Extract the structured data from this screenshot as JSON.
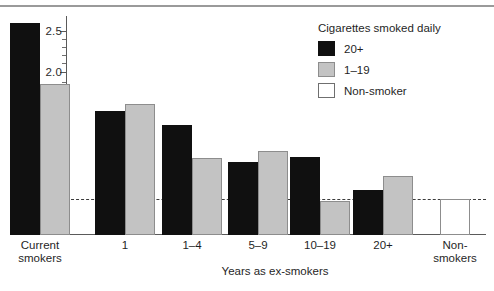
{
  "chart_data": {
    "type": "bar",
    "title": "",
    "xlabel": "Years as ex-smokers",
    "ylabel": "Mortality ratios",
    "categories": [
      "Current\nsmokers",
      "1",
      "1–4",
      "5–9",
      "10–19",
      "20+",
      "Non-\nsmokers"
    ],
    "yticks": [
      1.0,
      1.2,
      1.5,
      1.7,
      2.0,
      2.5
    ],
    "ytick_labels": [
      "1.0",
      "1.2",
      "1.5",
      "1.7",
      "2.0",
      "2.5"
    ],
    "ylim": [
      0.82,
      2.72
    ],
    "scale": "log",
    "grid": false,
    "reference_line": 1.0,
    "legend_title": "Cigarettes smoked daily",
    "legend_position": "top-right",
    "series": [
      {
        "name": "20+",
        "color": "#101010",
        "values": [
          2.62,
          1.62,
          1.5,
          1.22,
          1.26,
          1.05,
          null
        ]
      },
      {
        "name": "1–19",
        "color": "#c3c3c3",
        "values": [
          1.87,
          1.68,
          1.25,
          1.3,
          0.99,
          1.13,
          null
        ]
      },
      {
        "name": "Non-smoker",
        "color": "#ffffff",
        "values": [
          null,
          null,
          null,
          null,
          null,
          null,
          1.0
        ]
      }
    ]
  },
  "legend": {
    "title": "Cigarettes smoked daily",
    "items": [
      {
        "label": "20+",
        "swatch": "black"
      },
      {
        "label": "1–19",
        "swatch": "gray"
      },
      {
        "label": "Non-smoker",
        "swatch": "white"
      }
    ]
  },
  "axes": {
    "y_title": "Mortality ratios",
    "x_title": "Years as ex-smokers"
  }
}
